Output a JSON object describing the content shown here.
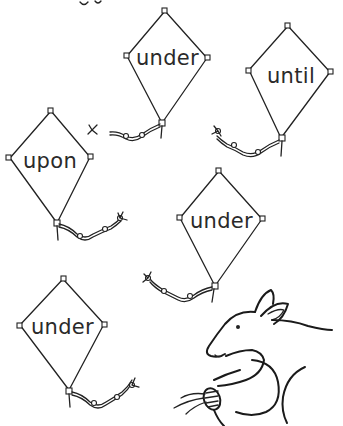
{
  "worksheet": {
    "kites": [
      {
        "id": "kite-1",
        "word": "under"
      },
      {
        "id": "kite-2",
        "word": "until"
      },
      {
        "id": "kite-3",
        "word": "upon"
      },
      {
        "id": "kite-4",
        "word": "under"
      },
      {
        "id": "kite-5",
        "word": "under"
      }
    ],
    "illustration": "kangaroo-holding-kite-string"
  }
}
